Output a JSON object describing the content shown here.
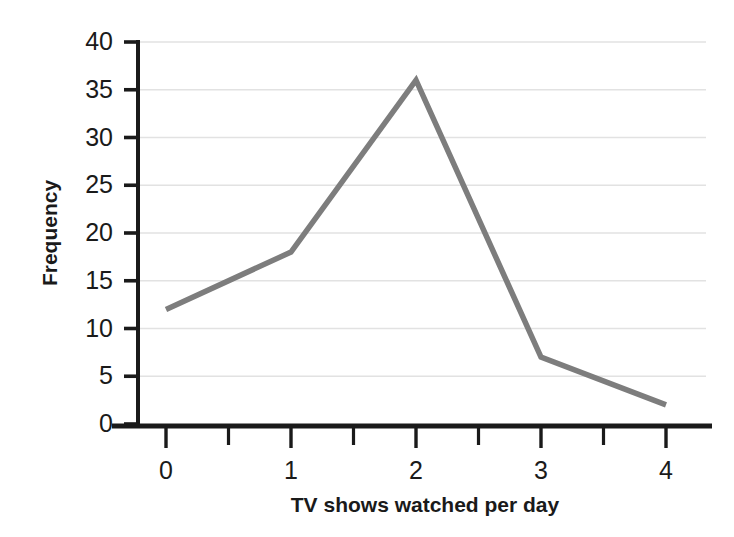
{
  "chart_data": {
    "type": "line",
    "title": "",
    "subtitle": "",
    "xlabel": "TV shows watched per day",
    "ylabel": "Frequency",
    "x": [
      0,
      1,
      2,
      3,
      4
    ],
    "categories": [
      "0",
      "1",
      "2",
      "3",
      "4"
    ],
    "values": [
      12,
      18,
      36,
      7,
      2
    ],
    "series": [
      {
        "name": "Frequency",
        "values": [
          12,
          18,
          36,
          7,
          2
        ]
      }
    ],
    "xlim": [
      0,
      4
    ],
    "ylim": [
      0,
      40
    ],
    "x_tick_labels": [
      "0",
      "1",
      "2",
      "3",
      "4"
    ],
    "x_tick_values": [
      0,
      1,
      2,
      3,
      4
    ],
    "x_minor_tick_values": [
      0.5,
      1.5,
      2.5,
      3.5
    ],
    "y_tick_labels": [
      "0",
      "5",
      "10",
      "15",
      "20",
      "25",
      "30",
      "35",
      "40"
    ],
    "y_tick_values": [
      0,
      5,
      10,
      15,
      20,
      25,
      30,
      35,
      40
    ],
    "grid": true,
    "grid_axis": "y",
    "legend": false,
    "legend_position": "none",
    "annotations": [],
    "colors": {
      "line": "#7d7d7d",
      "grid": "#e2e2e2",
      "axis": "#1a1a1a",
      "background": "#ffffff",
      "text": "#1a1a1a"
    }
  }
}
